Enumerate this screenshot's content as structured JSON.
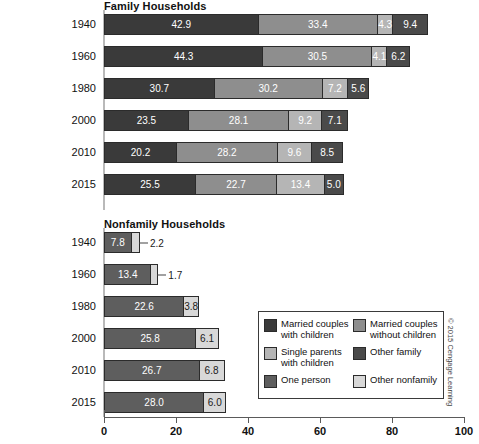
{
  "chart_data": {
    "type": "bar",
    "orientation": "horizontal",
    "stacked": true,
    "title": "",
    "xlabel": "",
    "ylabel": "",
    "xlim": [
      0,
      100
    ],
    "xticks": [
      0,
      20,
      40,
      60,
      80,
      100
    ],
    "xticklabels": [
      "0",
      "20",
      "40",
      "60",
      "80",
      "100"
    ],
    "grid": false,
    "legend_position": "bottom-right",
    "panels": [
      {
        "title": "Family Households",
        "categories": [
          "1940",
          "1960",
          "1980",
          "2000",
          "2010",
          "2015"
        ],
        "series": [
          {
            "name": "Married couples with children",
            "color": "#3a3a3a",
            "values": [
              42.9,
              44.3,
              30.7,
              23.5,
              20.2,
              25.5
            ]
          },
          {
            "name": "Married couples without children",
            "color": "#8e8e8e",
            "values": [
              33.4,
              30.5,
              30.2,
              28.1,
              28.2,
              22.7
            ]
          },
          {
            "name": "Single parents with children",
            "color": "#b5b5b5",
            "values": [
              4.3,
              4.1,
              7.2,
              9.2,
              9.6,
              13.4
            ]
          },
          {
            "name": "Other family",
            "color": "#4a4a4a",
            "values": [
              9.4,
              6.2,
              5.6,
              7.1,
              8.5,
              5.0
            ]
          }
        ]
      },
      {
        "title": "Nonfamily Households",
        "categories": [
          "1940",
          "1960",
          "1980",
          "2000",
          "2010",
          "2015"
        ],
        "series": [
          {
            "name": "One person",
            "color": "#5e5e5e",
            "values": [
              7.8,
              13.4,
              22.6,
              25.8,
              26.7,
              28.0
            ]
          },
          {
            "name": "Other nonfamily",
            "color": "#d8d8d8",
            "values": [
              2.2,
              1.7,
              3.8,
              6.1,
              6.8,
              6.0
            ]
          }
        ]
      }
    ]
  },
  "panels": [
    {
      "title": "Family Households",
      "rows": [
        {
          "year": "1940",
          "segments": [
            {
              "value": "42.9",
              "pct": 42.9,
              "color": "#3a3a3a",
              "label_inside": true,
              "dark_text": false
            },
            {
              "value": "33.4",
              "pct": 33.4,
              "color": "#8e8e8e",
              "label_inside": true,
              "dark_text": false
            },
            {
              "value": "4.3",
              "pct": 4.3,
              "color": "#b5b5b5",
              "label_inside": true,
              "dark_text": false
            },
            {
              "value": "9.4",
              "pct": 9.4,
              "color": "#4a4a4a",
              "label_inside": true,
              "dark_text": false
            }
          ]
        },
        {
          "year": "1960",
          "segments": [
            {
              "value": "44.3",
              "pct": 44.3,
              "color": "#3a3a3a",
              "label_inside": true,
              "dark_text": false
            },
            {
              "value": "30.5",
              "pct": 30.5,
              "color": "#8e8e8e",
              "label_inside": true,
              "dark_text": false
            },
            {
              "value": "4.1",
              "pct": 4.1,
              "color": "#b5b5b5",
              "label_inside": true,
              "dark_text": false
            },
            {
              "value": "6.2",
              "pct": 6.2,
              "color": "#4a4a4a",
              "label_inside": true,
              "dark_text": false
            }
          ]
        },
        {
          "year": "1980",
          "segments": [
            {
              "value": "30.7",
              "pct": 30.7,
              "color": "#3a3a3a",
              "label_inside": true,
              "dark_text": false
            },
            {
              "value": "30.2",
              "pct": 30.2,
              "color": "#8e8e8e",
              "label_inside": true,
              "dark_text": false
            },
            {
              "value": "7.2",
              "pct": 7.2,
              "color": "#b5b5b5",
              "label_inside": true,
              "dark_text": false
            },
            {
              "value": "5.6",
              "pct": 5.6,
              "color": "#4a4a4a",
              "label_inside": true,
              "dark_text": false
            }
          ]
        },
        {
          "year": "2000",
          "segments": [
            {
              "value": "23.5",
              "pct": 23.5,
              "color": "#3a3a3a",
              "label_inside": true,
              "dark_text": false
            },
            {
              "value": "28.1",
              "pct": 28.1,
              "color": "#8e8e8e",
              "label_inside": true,
              "dark_text": false
            },
            {
              "value": "9.2",
              "pct": 9.2,
              "color": "#b5b5b5",
              "label_inside": true,
              "dark_text": false
            },
            {
              "value": "7.1",
              "pct": 7.1,
              "color": "#4a4a4a",
              "label_inside": true,
              "dark_text": false
            }
          ]
        },
        {
          "year": "2010",
          "segments": [
            {
              "value": "20.2",
              "pct": 20.2,
              "color": "#3a3a3a",
              "label_inside": true,
              "dark_text": false
            },
            {
              "value": "28.2",
              "pct": 28.2,
              "color": "#8e8e8e",
              "label_inside": true,
              "dark_text": false
            },
            {
              "value": "9.6",
              "pct": 9.6,
              "color": "#b5b5b5",
              "label_inside": true,
              "dark_text": false
            },
            {
              "value": "8.5",
              "pct": 8.5,
              "color": "#4a4a4a",
              "label_inside": true,
              "dark_text": false
            }
          ]
        },
        {
          "year": "2015",
          "segments": [
            {
              "value": "25.5",
              "pct": 25.5,
              "color": "#3a3a3a",
              "label_inside": true,
              "dark_text": false
            },
            {
              "value": "22.7",
              "pct": 22.7,
              "color": "#8e8e8e",
              "label_inside": true,
              "dark_text": false
            },
            {
              "value": "13.4",
              "pct": 13.4,
              "color": "#b5b5b5",
              "label_inside": true,
              "dark_text": false
            },
            {
              "value": "5.0",
              "pct": 5.0,
              "color": "#4a4a4a",
              "label_inside": true,
              "dark_text": false
            }
          ]
        }
      ]
    },
    {
      "title": "Nonfamily Households",
      "rows": [
        {
          "year": "1940",
          "segments": [
            {
              "value": "7.8",
              "pct": 7.8,
              "color": "#5e5e5e",
              "label_inside": true,
              "dark_text": false
            },
            {
              "value": "2.2",
              "pct": 2.2,
              "color": "#d8d8d8",
              "label_inside": false,
              "dark_text": true
            }
          ]
        },
        {
          "year": "1960",
          "segments": [
            {
              "value": "13.4",
              "pct": 13.4,
              "color": "#5e5e5e",
              "label_inside": true,
              "dark_text": false
            },
            {
              "value": "1.7",
              "pct": 1.7,
              "color": "#d8d8d8",
              "label_inside": false,
              "dark_text": true
            }
          ]
        },
        {
          "year": "1980",
          "segments": [
            {
              "value": "22.6",
              "pct": 22.6,
              "color": "#5e5e5e",
              "label_inside": true,
              "dark_text": false
            },
            {
              "value": "3.8",
              "pct": 3.8,
              "color": "#d8d8d8",
              "label_inside": true,
              "dark_text": true
            }
          ]
        },
        {
          "year": "2000",
          "segments": [
            {
              "value": "25.8",
              "pct": 25.8,
              "color": "#5e5e5e",
              "label_inside": true,
              "dark_text": false
            },
            {
              "value": "6.1",
              "pct": 6.1,
              "color": "#d8d8d8",
              "label_inside": true,
              "dark_text": true
            }
          ]
        },
        {
          "year": "2010",
          "segments": [
            {
              "value": "26.7",
              "pct": 26.7,
              "color": "#5e5e5e",
              "label_inside": true,
              "dark_text": false
            },
            {
              "value": "6.8",
              "pct": 6.8,
              "color": "#d8d8d8",
              "label_inside": true,
              "dark_text": true
            }
          ]
        },
        {
          "year": "2015",
          "segments": [
            {
              "value": "28.0",
              "pct": 28.0,
              "color": "#5e5e5e",
              "label_inside": true,
              "dark_text": false
            },
            {
              "value": "6.0",
              "pct": 6.0,
              "color": "#d8d8d8",
              "label_inside": true,
              "dark_text": true
            }
          ]
        }
      ]
    }
  ],
  "axis": {
    "ticks": [
      {
        "label": "0",
        "value": 0
      },
      {
        "label": "20",
        "value": 20
      },
      {
        "label": "40",
        "value": 40
      },
      {
        "label": "60",
        "value": 60
      },
      {
        "label": "80",
        "value": 80
      },
      {
        "label": "100",
        "value": 100
      }
    ]
  },
  "legend": {
    "left_column": [
      {
        "label": "Married couples\nwith children",
        "color": "#3a3a3a",
        "icon": "legend-swatch-married-with-children"
      },
      {
        "label": "Single parents\nwith children",
        "color": "#b5b5b5",
        "icon": "legend-swatch-single-parents"
      },
      {
        "label": "One person",
        "color": "#5e5e5e",
        "icon": "legend-swatch-one-person"
      }
    ],
    "right_column": [
      {
        "label": "Married couples\nwithout children",
        "color": "#8e8e8e",
        "icon": "legend-swatch-married-without-children"
      },
      {
        "label": "Other family",
        "color": "#4a4a4a",
        "icon": "legend-swatch-other-family"
      },
      {
        "label": "Other nonfamily",
        "color": "#d8d8d8",
        "icon": "legend-swatch-other-nonfamily"
      }
    ]
  },
  "copyright": "© 2015 Cengage Learning"
}
